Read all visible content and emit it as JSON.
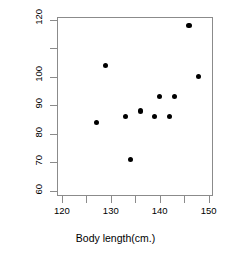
{
  "chart_data": {
    "type": "scatter",
    "title": "",
    "xlabel": "Body length(cm.)",
    "ylabel": "Weight(lbs)",
    "xlim": [
      119,
      150.9
    ],
    "ylim": [
      58.2,
      121
    ],
    "xticks": [
      120,
      125,
      130,
      135,
      140,
      145,
      150
    ],
    "xtick_labels": [
      "120",
      "",
      "130",
      "",
      "140",
      "",
      "150"
    ],
    "yticks": [
      60,
      70,
      80,
      90,
      100,
      110,
      120
    ],
    "ytick_labels": [
      "60",
      "70",
      "80",
      "90",
      "100",
      "",
      "120"
    ],
    "grid": false,
    "legend": null,
    "marker": "filled-circle",
    "marker_color": "#000000",
    "points": [
      {
        "x": 127,
        "y": 84
      },
      {
        "x": 129,
        "y": 104
      },
      {
        "x": 133,
        "y": 86
      },
      {
        "x": 134,
        "y": 71
      },
      {
        "x": 136,
        "y": 88
      },
      {
        "x": 139,
        "y": 86
      },
      {
        "x": 140,
        "y": 93
      },
      {
        "x": 142,
        "y": 86
      },
      {
        "x": 143,
        "y": 93
      },
      {
        "x": 146,
        "y": 118
      },
      {
        "x": 148,
        "y": 100
      }
    ]
  }
}
